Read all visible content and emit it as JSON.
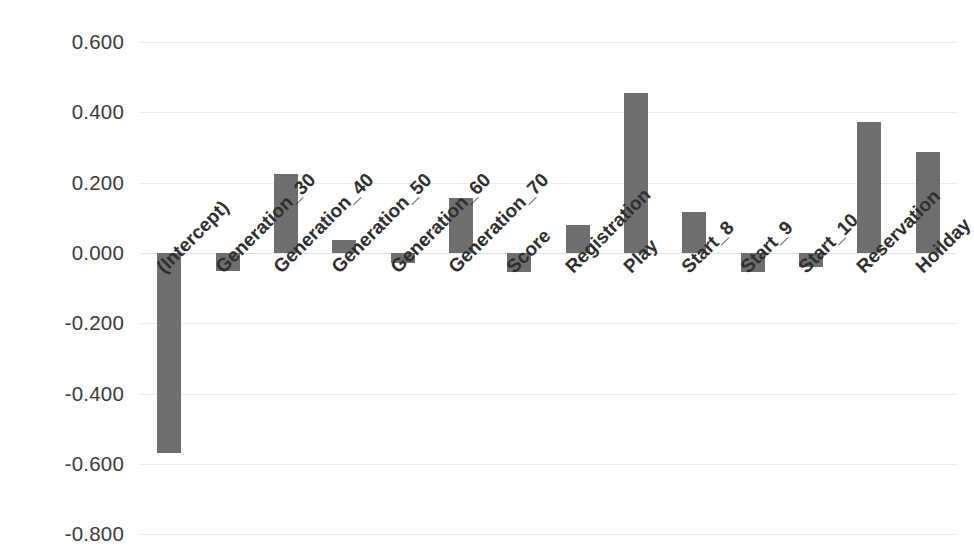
{
  "chart_data": {
    "type": "bar",
    "title": "",
    "subtitle": "",
    "xlabel": "",
    "ylabel": "",
    "orientation": "vertical",
    "grid": true,
    "legend": false,
    "legend_position": "none",
    "bar_color": "#706F6F",
    "axis_text_color": "#3B3B3B",
    "gridline_color": "#EAEAEA",
    "ylim": [
      -0.8,
      0.6
    ],
    "ytick_labels": [
      "0.600",
      "0.400",
      "0.200",
      "0.000",
      "-0.200",
      "-0.400",
      "-0.600",
      "-0.800"
    ],
    "ytick_values": [
      0.6,
      0.4,
      0.2,
      0.0,
      -0.2,
      -0.4,
      -0.6,
      -0.8
    ],
    "categories": [
      "(Intercept)",
      "Generation_30",
      "Generation_40",
      "Generation_50",
      "Generation_60",
      "Generation_70",
      "Score",
      "Registration",
      "Play",
      "Start_8",
      "Start_9",
      "Start_10",
      "Reservation",
      "Hoilday"
    ],
    "values": [
      -0.568,
      -0.051,
      0.226,
      0.037,
      -0.029,
      0.157,
      -0.054,
      0.08,
      0.454,
      0.117,
      -0.054,
      -0.04,
      0.374,
      0.286
    ]
  }
}
